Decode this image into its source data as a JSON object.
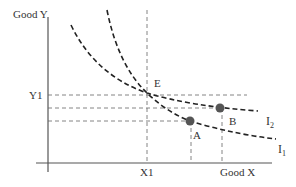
{
  "diagram": {
    "axes": {
      "y_label": "Good Y",
      "x_label": "Good X",
      "y_tick": "Y1",
      "x_tick": "X1"
    },
    "points": {
      "E": "E",
      "A": "A",
      "B": "B"
    },
    "curves": {
      "I1": {
        "main": "I",
        "sub": "1"
      },
      "I2": {
        "main": "I",
        "sub": "2"
      }
    },
    "colors": {
      "axis": "#555555",
      "curve": "#222222",
      "guide": "#666666",
      "point": "#555555",
      "text": "#333333"
    }
  }
}
